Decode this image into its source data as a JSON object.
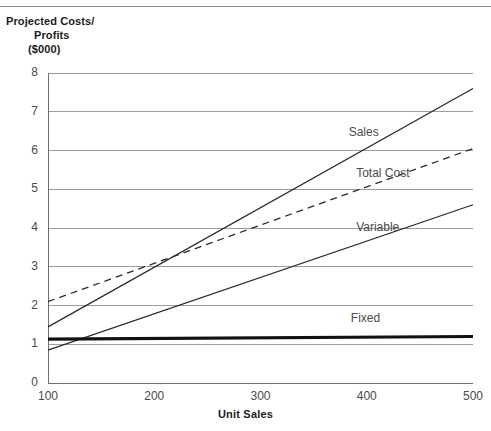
{
  "chart_data": {
    "type": "line",
    "title": "Projected Costs/ Profits ($000)",
    "title_lines": [
      "Projected Costs/",
      "Profits",
      "($000)"
    ],
    "xlabel": "Unit Sales",
    "ylabel": "Projected Costs/Profits ($000)",
    "x": [
      100,
      500
    ],
    "xlim": [
      100,
      500
    ],
    "ylim": [
      0,
      8
    ],
    "xticks": [
      "100",
      "200",
      "300",
      "400",
      "500"
    ],
    "yticks": [
      "0",
      "1",
      "2",
      "3",
      "4",
      "5",
      "6",
      "7",
      "8"
    ],
    "grid": "horizontal",
    "legend": "inline-labels",
    "series": [
      {
        "name": "Sales",
        "label": "Sales",
        "style": "solid",
        "width": 1.3,
        "color": "#2b2b2b",
        "x": [
          100,
          500
        ],
        "values": [
          1.45,
          7.6
        ]
      },
      {
        "name": "Total Cost",
        "label": "Total Cost",
        "style": "dashed",
        "width": 1.3,
        "color": "#2b2b2b",
        "x": [
          100,
          500
        ],
        "values": [
          2.1,
          6.05
        ]
      },
      {
        "name": "Variable",
        "label": "Variable",
        "style": "solid",
        "width": 1.3,
        "color": "#2b2b2b",
        "x": [
          100,
          500
        ],
        "values": [
          0.85,
          4.6
        ]
      },
      {
        "name": "Fixed",
        "label": "Fixed",
        "style": "solid-thick",
        "width": 3.2,
        "color": "#111111",
        "x": [
          100,
          500
        ],
        "values": [
          1.13,
          1.2
        ]
      }
    ],
    "annotations": [
      {
        "text": "Sales",
        "x": 383,
        "y": 6.45
      },
      {
        "text": "Total Cost",
        "x": 390,
        "y": 5.4
      },
      {
        "text": "Variable",
        "x": 390,
        "y": 4.0
      },
      {
        "text": "Fixed",
        "x": 385,
        "y": 1.65
      }
    ],
    "colors": {
      "grid": "#9d9d9d",
      "axis": "#6f6f6f",
      "line": "#2b2b2b",
      "thick_line": "#111111",
      "text": "#4a4a4a",
      "title_text": "#1c1c1c"
    }
  },
  "axes": {
    "y_ticks": [
      {
        "label": "8",
        "value": 8
      },
      {
        "label": "7",
        "value": 7
      },
      {
        "label": "6",
        "value": 6
      },
      {
        "label": "5",
        "value": 5
      },
      {
        "label": "4",
        "value": 4
      },
      {
        "label": "3",
        "value": 3
      },
      {
        "label": "2",
        "value": 2
      },
      {
        "label": "1",
        "value": 1
      },
      {
        "label": "0",
        "value": 0
      }
    ],
    "x_ticks": [
      {
        "label": "100",
        "value": 100
      },
      {
        "label": "200",
        "value": 200
      },
      {
        "label": "300",
        "value": 300
      },
      {
        "label": "400",
        "value": 400
      },
      {
        "label": "500",
        "value": 500
      }
    ],
    "x_axis_title": "Unit Sales"
  },
  "title": {
    "line1": "Projected Costs/",
    "line2": "Profits",
    "line3": "($000)"
  },
  "labels": {
    "sales": "Sales",
    "total_cost": "Total Cost",
    "variable": "Variable",
    "fixed": "Fixed"
  }
}
